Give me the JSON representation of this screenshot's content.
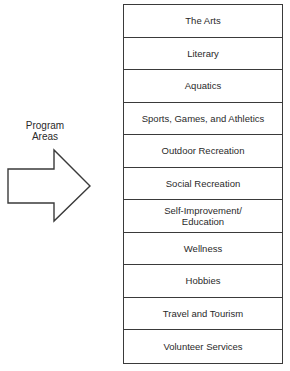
{
  "diagram": {
    "label": {
      "line1": "Program",
      "line2": "Areas"
    },
    "arrow": {
      "direction": "right",
      "icon": "block-arrow-right-icon"
    },
    "program_areas": [
      {
        "label": "The Arts"
      },
      {
        "label": "Literary"
      },
      {
        "label": "Aquatics"
      },
      {
        "label": "Sports, Games, and Athletics"
      },
      {
        "label": "Outdoor Recreation"
      },
      {
        "label": "Social Recreation"
      },
      {
        "label": "Self-Improvement/\nEducation"
      },
      {
        "label": "Wellness"
      },
      {
        "label": "Hobbies"
      },
      {
        "label": "Travel and Tourism"
      },
      {
        "label": "Volunteer Services"
      }
    ]
  }
}
